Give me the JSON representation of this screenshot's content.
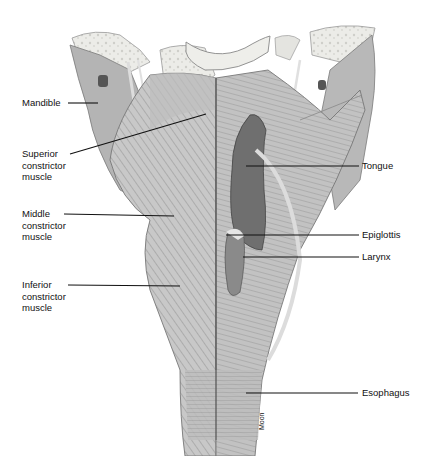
{
  "figure": {
    "credit": "Moon",
    "labels": [
      {
        "id": "mandible",
        "text": "Mandible",
        "side": "left"
      },
      {
        "id": "superior-constrictor",
        "text": "Superior\nconstrictor\nmuscle",
        "side": "left"
      },
      {
        "id": "middle-constrictor",
        "text": "Middle\nconstrictor\nmuscle",
        "side": "left"
      },
      {
        "id": "inferior-constrictor",
        "text": "Inferior\nconstrictor\nmuscle",
        "side": "left"
      },
      {
        "id": "tongue",
        "text": "Tongue",
        "side": "right"
      },
      {
        "id": "epiglottis",
        "text": "Epiglottis",
        "side": "right"
      },
      {
        "id": "larynx",
        "text": "Larynx",
        "side": "right"
      },
      {
        "id": "esophagus",
        "text": "Esophagus",
        "side": "right"
      }
    ]
  },
  "colors": {
    "background": "#ffffff",
    "bone": "#e6e6e2",
    "muscle_light": "#c9c9c9",
    "muscle_mid": "#a8a8a8",
    "muscle_dark": "#7d7d7d",
    "cavity": "#6e6e6e",
    "leader": "#111111"
  }
}
